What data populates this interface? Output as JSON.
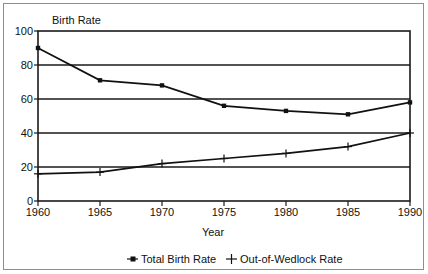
{
  "chart_data": {
    "type": "line",
    "title": "",
    "ylabel": "Birth Rate",
    "xlabel": "Year",
    "categories": [
      1960,
      1965,
      1970,
      1975,
      1980,
      1985,
      1990
    ],
    "x_tick_labels": [
      "1960",
      "1965",
      "1970",
      "1975",
      "1980",
      "1985",
      "1990"
    ],
    "y_tick_labels": [
      "0",
      "20",
      "40",
      "60",
      "80",
      "100"
    ],
    "y_ticks": [
      0,
      20,
      40,
      60,
      80,
      100
    ],
    "ylim": [
      0,
      100
    ],
    "xlim": [
      1960,
      1990
    ],
    "grid": "horizontal",
    "legend_position": "bottom",
    "series": [
      {
        "name": "Total Birth Rate",
        "marker": "square",
        "color": "#111111",
        "values": [
          90,
          71,
          68,
          56,
          53,
          51,
          58
        ]
      },
      {
        "name": "Out-of-Wedlock Rate",
        "marker": "plus",
        "color": "#111111",
        "values": [
          16,
          17,
          22,
          25,
          28,
          32,
          40
        ]
      }
    ]
  },
  "legend": {
    "items": [
      {
        "label": "Total Birth Rate",
        "marker": "square"
      },
      {
        "label": "Out-of-Wedlock Rate",
        "marker": "plus"
      }
    ]
  },
  "colors": {
    "ink": "#111111",
    "frame": "#8e8e8e",
    "background": "#ffffff"
  }
}
